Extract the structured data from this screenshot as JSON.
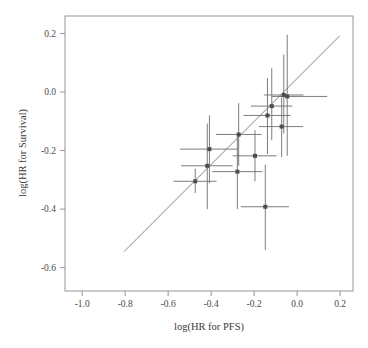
{
  "chart_data": {
    "type": "scatter",
    "title": "",
    "xlabel": "log(HR for PFS)",
    "ylabel": "log(HR for Survival)",
    "xlim": [
      -1.08,
      0.26
    ],
    "ylim": [
      -0.68,
      0.26
    ],
    "xticks": [
      -1.0,
      -0.8,
      -0.6,
      -0.4,
      -0.2,
      0.0,
      0.2
    ],
    "xticklabels": [
      "-1.0",
      "-0.8",
      "-0.6",
      "-0.4",
      "-0.2",
      "0.0",
      "0.2"
    ],
    "yticks": [
      0.2,
      0.0,
      -0.2,
      -0.4,
      -0.6
    ],
    "yticklabels": [
      "0.2",
      "0.0",
      "-0.2",
      "-0.4",
      "-0.6"
    ],
    "grid": false,
    "legend": null,
    "marker": "square",
    "marker_color": "#4d4d4d",
    "errorbar_color": "#6e6e6e",
    "line_color": "#6e6e6e",
    "points": [
      {
        "x": -0.474,
        "y": -0.305,
        "xlo": -0.575,
        "xhi": -0.375,
        "ylo": -0.345,
        "yhi": -0.262
      },
      {
        "x": -0.418,
        "y": -0.252,
        "xlo": -0.54,
        "xhi": -0.3,
        "ylo": -0.4,
        "yhi": -0.108
      },
      {
        "x": -0.408,
        "y": -0.195,
        "xlo": -0.545,
        "xhi": -0.275,
        "ylo": -0.312,
        "yhi": -0.08
      },
      {
        "x": -0.278,
        "y": -0.272,
        "xlo": -0.395,
        "xhi": -0.162,
        "ylo": -0.4,
        "yhi": -0.145
      },
      {
        "x": -0.272,
        "y": -0.145,
        "xlo": -0.378,
        "xhi": -0.165,
        "ylo": -0.252,
        "yhi": -0.038
      },
      {
        "x": -0.196,
        "y": -0.218,
        "xlo": -0.3,
        "xhi": -0.095,
        "ylo": -0.305,
        "yhi": -0.13
      },
      {
        "x": -0.148,
        "y": -0.392,
        "xlo": -0.262,
        "xhi": -0.038,
        "ylo": -0.54,
        "yhi": -0.248
      },
      {
        "x": -0.138,
        "y": -0.08,
        "xlo": -0.25,
        "xhi": -0.03,
        "ylo": -0.212,
        "yhi": 0.048
      },
      {
        "x": -0.118,
        "y": -0.048,
        "xlo": -0.215,
        "xhi": -0.022,
        "ylo": -0.165,
        "yhi": 0.082
      },
      {
        "x": -0.072,
        "y": -0.118,
        "xlo": -0.178,
        "xhi": 0.028,
        "ylo": -0.222,
        "yhi": -0.018
      },
      {
        "x": -0.062,
        "y": -0.01,
        "xlo": -0.155,
        "xhi": 0.03,
        "ylo": -0.142,
        "yhi": 0.128
      },
      {
        "x": -0.046,
        "y": -0.015,
        "xlo": -0.118,
        "xhi": 0.14,
        "ylo": -0.218,
        "yhi": 0.196
      }
    ],
    "fit_line": {
      "x0": -0.805,
      "y0": -0.545,
      "x1": 0.198,
      "y1": 0.192
    }
  }
}
